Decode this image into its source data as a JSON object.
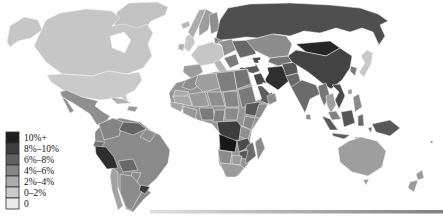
{
  "map": {
    "ocean_color": "#fefefe"
  },
  "shadow": {
    "start_color": "#e0e0e0",
    "end_color": "#7f7f7f"
  },
  "legend": {
    "items": [
      {
        "label": "10%+",
        "color": "#1e1e1e"
      },
      {
        "label": "8%–10%",
        "color": "#3f3f3f"
      },
      {
        "label": "6%–8%",
        "color": "#616161"
      },
      {
        "label": "4%–6%",
        "color": "#868686"
      },
      {
        "label": "2%–4%",
        "color": "#ababab"
      },
      {
        "label": "0–2%",
        "color": "#cbcbcb"
      },
      {
        "label": "0",
        "color": "#ebebeb"
      }
    ]
  },
  "regions": {
    "greenland": {
      "name": "Greenland",
      "color": "#c2c2c2"
    },
    "alaska": {
      "name": "Alaska (US)",
      "color": "#c6c6c6"
    },
    "canada": {
      "name": "Canada",
      "color": "#c6c6c6"
    },
    "usa": {
      "name": "United States",
      "color": "#c9c9c9"
    },
    "mexico": {
      "name": "Mexico",
      "color": "#8f8f8f"
    },
    "central_america": {
      "name": "Central America",
      "color": "#6f6f6f"
    },
    "cuba": {
      "name": "Cuba",
      "color": "#aeaeae"
    },
    "hispaniola": {
      "name": "Hispaniola",
      "color": "#989898"
    },
    "brazil": {
      "name": "Brazil",
      "color": "#8a8a8a"
    },
    "colombia": {
      "name": "Colombia",
      "color": "#848484"
    },
    "venezuela": {
      "name": "Venezuela",
      "color": "#646464"
    },
    "guyanas": {
      "name": "Guyanas",
      "color": "#8f8f8f"
    },
    "ecuador": {
      "name": "Ecuador",
      "color": "#707070"
    },
    "peru": {
      "name": "Peru",
      "color": "#2e2e2e"
    },
    "bolivia": {
      "name": "Bolivia",
      "color": "#686868"
    },
    "paraguay": {
      "name": "Paraguay",
      "color": "#8a8a8a"
    },
    "uruguay": {
      "name": "Uruguay",
      "color": "#3a3a3a"
    },
    "argentina": {
      "name": "Argentina",
      "color": "#8c8c8c"
    },
    "chile": {
      "name": "Chile",
      "color": "#a2a2a2"
    },
    "iceland": {
      "name": "Iceland",
      "color": "#b8b8b8"
    },
    "uk": {
      "name": "United Kingdom",
      "color": "#c8c8c8"
    },
    "ireland": {
      "name": "Ireland",
      "color": "#b2b2b2"
    },
    "norway": {
      "name": "Norway",
      "color": "#ababab"
    },
    "sweden": {
      "name": "Sweden",
      "color": "#9c9c9c"
    },
    "finland": {
      "name": "Finland",
      "color": "#8e8e8e"
    },
    "baltics": {
      "name": "Baltic states",
      "color": "#8a8a8a"
    },
    "western_europe": {
      "name": "Western Europe",
      "color": "#c6c6c6"
    },
    "spain": {
      "name": "Iberia",
      "color": "#9c9c9c"
    },
    "italy": {
      "name": "Italy",
      "color": "#b4b4b4"
    },
    "eastern_europe": {
      "name": "Eastern Europe",
      "color": "#909090"
    },
    "balkans": {
      "name": "Balkans",
      "color": "#7c7c7c"
    },
    "ukraine": {
      "name": "Ukraine",
      "color": "#696969"
    },
    "russia": {
      "name": "Russia",
      "color": "#4f4f4f"
    },
    "kazakhstan": {
      "name": "Kazakhstan",
      "color": "#8c8c8c"
    },
    "central_asia": {
      "name": "Central Asia",
      "color": "#767676"
    },
    "caucasus": {
      "name": "Caucasus",
      "color": "#4e4e4e"
    },
    "turkey": {
      "name": "Turkey",
      "color": "#5c5c5c"
    },
    "syria_iraq": {
      "name": "Syria & Iraq",
      "color": "#484848"
    },
    "iran": {
      "name": "Iran",
      "color": "#2f2f2f"
    },
    "saudi_arabia": {
      "name": "Saudi Arabia",
      "color": "#5e5e5e"
    },
    "yemen": {
      "name": "Yemen",
      "color": "#787878"
    },
    "oman": {
      "name": "Oman",
      "color": "#8a8a8a"
    },
    "afghanistan": {
      "name": "Afghanistan",
      "color": "#575757"
    },
    "pakistan": {
      "name": "Pakistan",
      "color": "#6a6a6a"
    },
    "india": {
      "name": "India",
      "color": "#6b6b6b"
    },
    "sri_lanka": {
      "name": "Sri Lanka",
      "color": "#8a8a8a"
    },
    "myanmar": {
      "name": "Myanmar",
      "color": "#757575"
    },
    "thailand": {
      "name": "Thailand",
      "color": "#9e9e9e"
    },
    "vietnam": {
      "name": "Vietnam & Laos",
      "color": "#4a4a4a"
    },
    "malaysia": {
      "name": "Malaysia",
      "color": "#828282"
    },
    "mongolia": {
      "name": "Mongolia",
      "color": "#262626"
    },
    "china": {
      "name": "China",
      "color": "#434343"
    },
    "korea": {
      "name": "Korea",
      "color": "#7a7a7a"
    },
    "japan": {
      "name": "Japan",
      "color": "#c9c9c9"
    },
    "taiwan": {
      "name": "Taiwan",
      "color": "#999999"
    },
    "philippines": {
      "name": "Philippines",
      "color": "#8a8a8a"
    },
    "sumatra": {
      "name": "Sumatra",
      "color": "#5a5a5a"
    },
    "borneo": {
      "name": "Borneo",
      "color": "#565656"
    },
    "sulawesi": {
      "name": "Sulawesi",
      "color": "#6a6a6a"
    },
    "java": {
      "name": "Java",
      "color": "#5e5e5e"
    },
    "lesser_sunda": {
      "name": "Lesser Sunda Islands",
      "color": "#6e6e6e"
    },
    "moluccas": {
      "name": "Maluku Islands",
      "color": "#6e6e6e"
    },
    "new_guinea": {
      "name": "New Guinea",
      "color": "#585858"
    },
    "africa": {
      "name": "Africa (base)",
      "color": "#949494"
    },
    "morocco": {
      "name": "Morocco",
      "color": "#8c8c8c"
    },
    "western_sahara": {
      "name": "Western Sahara",
      "color": "#aaaaaa"
    },
    "algeria": {
      "name": "Algeria",
      "color": "#9e9e9e"
    },
    "libya": {
      "name": "Libya",
      "color": "#7e7e7e"
    },
    "egypt": {
      "name": "Egypt",
      "color": "#747474"
    },
    "mauritania": {
      "name": "Mauritania",
      "color": "#a8a8a8"
    },
    "mali": {
      "name": "Mali",
      "color": "#9a9a9a"
    },
    "niger": {
      "name": "Niger",
      "color": "#8e8e8e"
    },
    "chad": {
      "name": "Chad",
      "color": "#868686"
    },
    "sudan": {
      "name": "Sudan",
      "color": "#7a7a7a"
    },
    "senegal_guinea": {
      "name": "Senegal & Guinea",
      "color": "#a2a2a2"
    },
    "west_african_coast": {
      "name": "West African coast",
      "color": "#989898"
    },
    "nigeria": {
      "name": "Nigeria",
      "color": "#7a7a7a"
    },
    "cameroon": {
      "name": "Cameroon",
      "color": "#808080"
    },
    "central_african_republic": {
      "name": "Central African Republic",
      "color": "#8a8a8a"
    },
    "ethiopia": {
      "name": "Ethiopia",
      "color": "#585858"
    },
    "somalia": {
      "name": "Somalia",
      "color": "#8a8a8a"
    },
    "kenya": {
      "name": "Kenya",
      "color": "#888888"
    },
    "tanzania": {
      "name": "Tanzania",
      "color": "#909090"
    },
    "dr_congo": {
      "name": "DR Congo",
      "color": "#3e3e3e"
    },
    "angola": {
      "name": "Angola",
      "color": "#181818"
    },
    "zambia": {
      "name": "Zambia",
      "color": "#4c4c4c"
    },
    "mozambique": {
      "name": "Mozambique",
      "color": "#6c6c6c"
    },
    "zimbabwe": {
      "name": "Zimbabwe",
      "color": "#565656"
    },
    "namibia": {
      "name": "Namibia",
      "color": "#8c8c8c"
    },
    "botswana": {
      "name": "Botswana",
      "color": "#9c9c9c"
    },
    "south_africa": {
      "name": "South Africa",
      "color": "#9c9c9c"
    },
    "madagascar": {
      "name": "Madagascar",
      "color": "#8a8a8a"
    },
    "australia": {
      "name": "Australia",
      "color": "#9e9e9e"
    },
    "tasmania": {
      "name": "Tasmania",
      "color": "#9a9a9a"
    },
    "new_zealand": {
      "name": "New Zealand",
      "color": "#9a9a9a"
    },
    "pacific_islands": {
      "name": "Pacific islands",
      "color": "#777777"
    }
  }
}
